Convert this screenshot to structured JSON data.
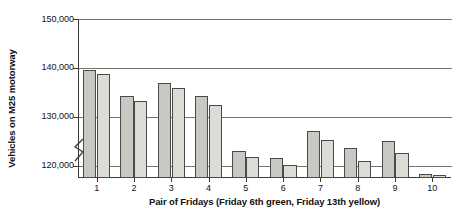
{
  "chart_data": {
    "type": "bar",
    "title": "",
    "xlabel": "Pair of Fridays (Friday 6th green, Friday 13th yellow)",
    "ylabel": "Vehicles on M25 motorway",
    "categories": [
      "1",
      "2",
      "3",
      "4",
      "5",
      "6",
      "7",
      "8",
      "9",
      "10"
    ],
    "ylim": [
      117500,
      150000
    ],
    "y_axis_broken": true,
    "y_ticks": [
      120000,
      130000,
      140000,
      150000
    ],
    "y_tick_labels": [
      "120,000",
      "130,000",
      "140,000",
      "150,000"
    ],
    "grid": "horizontal",
    "legend_position": "none",
    "series": [
      {
        "name": "Friday 6th green",
        "color": "#c9c9c4",
        "values": [
          139500,
          134200,
          136900,
          134200,
          123000,
          121500,
          127200,
          123600,
          125000,
          118300
        ]
      },
      {
        "name": "Friday 13th yellow",
        "color": "#dcdcd7",
        "values": [
          138800,
          133200,
          136000,
          132400,
          121800,
          120200,
          125200,
          120900,
          122700,
          118200
        ]
      }
    ]
  },
  "axes": {
    "y_title": "Vehicles on M25 motorway",
    "x_title": "Pair of Fridays (Friday 6th green, Friday 13th yellow)"
  },
  "colors": {
    "bar_green6": "#c9c9c4",
    "bar_yellow13": "#dcdcd7",
    "bar_outline": "#4a4a4a",
    "axis": "#3a3a3a",
    "gridline": "#76766f"
  }
}
